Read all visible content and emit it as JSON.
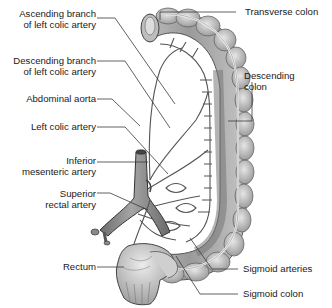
{
  "diagram": {
    "labels_left": [
      {
        "id": "ascending-branch",
        "line1": "Ascending branch",
        "line2": "of left colic artery"
      },
      {
        "id": "descending-branch",
        "line1": "Descending branch",
        "line2": "of left colic artery"
      },
      {
        "id": "abdominal-aorta",
        "line1": "Abdominal aorta"
      },
      {
        "id": "left-colic-artery",
        "line1": "Left colic artery"
      },
      {
        "id": "inferior-mesenteric-artery",
        "line1": "Inferior",
        "line2": "mesenteric artery"
      },
      {
        "id": "superior-rectal-artery",
        "line1": "Superior",
        "line2": "rectal artery"
      },
      {
        "id": "rectum",
        "line1": "Rectum"
      }
    ],
    "labels_right": [
      {
        "id": "transverse-colon",
        "line1": "Transverse colon"
      },
      {
        "id": "descending-colon",
        "line1": "Descending",
        "line2": "colon"
      },
      {
        "id": "sigmoid-arteries",
        "line1": "Sigmoid arteries"
      },
      {
        "id": "sigmoid-colon",
        "line1": "Sigmoid colon"
      }
    ],
    "colors": {
      "colon_light": "#d9d9d9",
      "colon_dark": "#8c8c8c",
      "artery": "#555555",
      "leader_line": "#3a3a3a",
      "text": "#1a1a1a",
      "background": "#ffffff"
    }
  }
}
